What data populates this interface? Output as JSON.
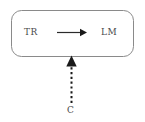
{
  "diagram": {
    "type": "block-diagram",
    "title": "",
    "background_color": "#ffffff",
    "stroke_color": "#8a8a8a",
    "text_color": "#4a4a4a",
    "container": {
      "shape": "rounded-rectangle",
      "name": "outer-box",
      "border_color": "#8a8a8a",
      "fill": "#ffffff"
    },
    "nodes": [
      {
        "id": "tr",
        "label": "TR",
        "icon": "text-label"
      },
      {
        "id": "lm",
        "label": "LM",
        "icon": "text-label"
      },
      {
        "id": "c",
        "label": "C",
        "icon": "text-label"
      }
    ],
    "edges": [
      {
        "id": "tr-to-lm",
        "from": "tr",
        "to": "lm",
        "style": "solid",
        "direction": "right",
        "arrowhead": "filled-triangle",
        "label": ""
      },
      {
        "id": "c-to-box",
        "from": "c",
        "to": "outer-box",
        "style": "dotted",
        "direction": "up",
        "arrowhead": "filled-triangle",
        "label": ""
      }
    ]
  }
}
